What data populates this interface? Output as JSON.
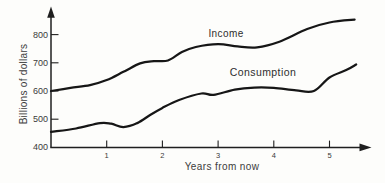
{
  "chart_data": {
    "type": "line",
    "title": "",
    "xlabel": "Years from now",
    "ylabel": "Billions of dollars",
    "x_ticks": [
      1,
      2,
      3,
      4,
      5
    ],
    "y_ticks": [
      400,
      500,
      600,
      700,
      800
    ],
    "xlim": [
      0,
      5.75
    ],
    "ylim": [
      400,
      880
    ],
    "grid": false,
    "legend_position": "inline-curve-labels",
    "axis_color": "#1f1f1f",
    "line_color": "#161616",
    "text_color": "#3a3a3a",
    "series": [
      {
        "name": "Income",
        "x": [
          0,
          0.35,
          0.7,
          1.0,
          1.3,
          1.6,
          1.85,
          2.1,
          2.35,
          2.6,
          3.0,
          3.35,
          3.7,
          4.1,
          4.6,
          5.0,
          5.45
        ],
        "y": [
          600,
          611,
          621,
          639,
          668,
          698,
          706,
          708,
          738,
          756,
          766,
          758,
          755,
          775,
          820,
          843,
          853
        ]
      },
      {
        "name": "Consumption",
        "x": [
          0,
          0.45,
          0.88,
          1.08,
          1.3,
          1.55,
          1.78,
          2.0,
          2.3,
          2.7,
          2.92,
          3.3,
          3.65,
          4.0,
          4.4,
          4.72,
          5.0,
          5.3,
          5.48
        ],
        "y": [
          455,
          467,
          486,
          484,
          472,
          486,
          515,
          540,
          568,
          591,
          586,
          605,
          612,
          611,
          602,
          600,
          648,
          674,
          694
        ]
      }
    ]
  }
}
